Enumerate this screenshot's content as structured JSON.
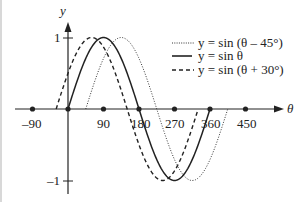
{
  "chart_data": {
    "type": "line",
    "title": "",
    "xlabel": "θ",
    "ylabel": "y",
    "xlim": [
      -90,
      450
    ],
    "ylim": [
      -1,
      1
    ],
    "x_ticks": [
      "-90",
      "90",
      "180",
      "270",
      "360",
      "450"
    ],
    "y_ticks": [
      "1",
      "-1"
    ],
    "grid": false,
    "legend_position": "upper right",
    "series": [
      {
        "name": "y = sin (θ – 45°)",
        "style": "dotted",
        "phase_deg": -45,
        "domain": [
          45,
          405
        ]
      },
      {
        "name": "y = sin θ",
        "style": "solid",
        "phase_deg": 0,
        "domain": [
          0,
          360
        ]
      },
      {
        "name": "y = sin (θ + 30°)",
        "style": "dashed",
        "phase_deg": 30,
        "domain": [
          -30,
          330
        ]
      }
    ]
  },
  "axis": {
    "x_label": "θ",
    "y_label": "y",
    "x_tick_labels": [
      "–90",
      "90",
      "180",
      "270",
      "360",
      "450"
    ],
    "y_top_label": "1",
    "y_bottom_label": "–1"
  },
  "legend": {
    "items": [
      {
        "text": "y = sin (θ – 45°)"
      },
      {
        "text": "y = sin θ"
      },
      {
        "text": "y = sin (θ + 30°)"
      }
    ]
  }
}
